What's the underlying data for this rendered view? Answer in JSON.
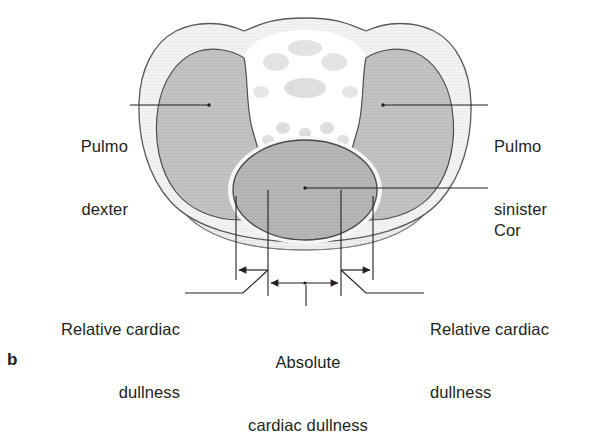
{
  "figure": {
    "panel_letter": "b",
    "background_color": "#ffffff",
    "ink_color": "#231f20"
  },
  "anatomy": {
    "thorax_wall": {
      "name": "thoracic wall",
      "fill": "#f2f2f2",
      "stroke": "#5a5a5a"
    },
    "mediastinum": {
      "name": "mediastinum",
      "fill": "#ffffff",
      "mottle_fill": "#dcdcdc"
    },
    "lung_right": {
      "name": "pulmo dexter",
      "fill": "#c2c2c2",
      "stroke": "#4f4f4f"
    },
    "lung_left": {
      "name": "pulmo sinister",
      "fill": "#c2c2c2",
      "stroke": "#4f4f4f"
    },
    "heart": {
      "name": "cor",
      "fill": "#b4b4b4",
      "stroke": "#4a4a4a",
      "halo": "#f4f4f4"
    },
    "diaphragm_base": {
      "name": "lower thoracic base",
      "fill": "#ededed",
      "stroke": "#6a6a6a"
    }
  },
  "labels": {
    "pulmo_dexter": {
      "line1": "Pulmo",
      "line2": "dexter",
      "align": "right",
      "x": 18,
      "y": 94,
      "width": 110
    },
    "pulmo_sinister": {
      "line1": "Pulmo",
      "line2": "sinister",
      "align": "left",
      "x": 494,
      "y": 94,
      "width": 112
    },
    "cor": {
      "line1": "Cor",
      "align": "left",
      "x": 494,
      "y": 178,
      "width": 90
    },
    "relative_left": {
      "line1": "Relative cardiac",
      "line2": "dullness",
      "align": "right",
      "x": 8,
      "y": 277,
      "width": 172
    },
    "relative_right": {
      "line1": "Relative cardiac",
      "line2": "dullness",
      "align": "left",
      "x": 430,
      "y": 277,
      "width": 175
    },
    "absolute_center": {
      "line1": "Absolute",
      "line2": "cardiac dullness",
      "align": "center",
      "x": 228,
      "y": 310,
      "width": 160
    }
  },
  "leader_lines": {
    "pulmo_dexter": {
      "from_x": 130,
      "from_y": 105,
      "to_x": 209,
      "to_y": 105,
      "dot": true
    },
    "pulmo_sinister": {
      "from_x": 488,
      "from_y": 105,
      "to_x": 383,
      "to_y": 105,
      "dot": true
    },
    "cor": {
      "from_x": 488,
      "from_y": 188,
      "to_x": 305,
      "to_y": 188,
      "dot": true
    },
    "relative_left": {
      "from_x": 185,
      "from_y": 293,
      "to_x": 243,
      "to_y": 293,
      "elbow_x": 268,
      "elbow_y": 270
    },
    "relative_right": {
      "from_x": 424,
      "from_y": 293,
      "to_x": 366,
      "to_y": 293,
      "elbow_x": 341,
      "elbow_y": 270
    },
    "absolute_center": {
      "from_x": 306,
      "from_y": 306,
      "to_x": 306,
      "to_y": 283
    }
  },
  "measurements": {
    "drop_lines": [
      {
        "name": "outer-left",
        "x": 236,
        "y_top": 196,
        "y_bottom": 280
      },
      {
        "name": "inner-left",
        "x": 268,
        "y_top": 190,
        "y_bottom": 296
      },
      {
        "name": "inner-right",
        "x": 341,
        "y_top": 190,
        "y_bottom": 296
      },
      {
        "name": "outer-right",
        "x": 373,
        "y_top": 196,
        "y_bottom": 280
      }
    ],
    "relative_dullness_left": {
      "from_x": 268,
      "to_x": 236,
      "y": 270,
      "arrow": "left"
    },
    "relative_dullness_right": {
      "from_x": 341,
      "to_x": 373,
      "y": 270,
      "arrow": "right"
    },
    "absolute_dullness": {
      "from_x": 268,
      "to_x": 341,
      "y": 283,
      "arrow": "both"
    }
  }
}
